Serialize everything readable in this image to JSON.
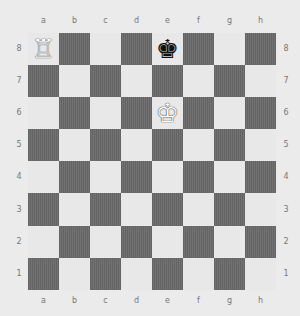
{
  "board": {
    "files": [
      "a",
      "b",
      "c",
      "d",
      "e",
      "f",
      "g",
      "h"
    ],
    "ranks": [
      "8",
      "7",
      "6",
      "5",
      "4",
      "3",
      "2",
      "1"
    ],
    "colors": {
      "light": "#e8e8e8",
      "dark": "#6a6a6a",
      "background": "#ebebeb"
    },
    "pieces": [
      {
        "square": "a8",
        "color": "white",
        "type": "rook",
        "glyph": "♖"
      },
      {
        "square": "e8",
        "color": "black",
        "type": "king",
        "glyph": "♚"
      },
      {
        "square": "e6",
        "color": "white",
        "type": "king",
        "glyph": "♔"
      }
    ]
  }
}
